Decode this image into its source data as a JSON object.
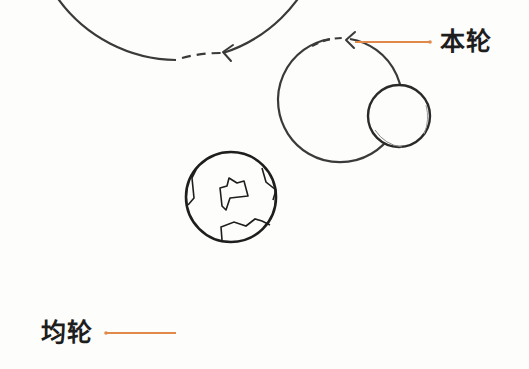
{
  "diagram": {
    "type": "epicycle-model",
    "labels": {
      "epicycle": "本轮",
      "deferent": "均轮"
    },
    "colors": {
      "line": "#3a3a3a",
      "leader": "#e0894a",
      "background": "#fdfdfb",
      "text": "#1e1e1e"
    },
    "elements": [
      {
        "name": "deferent",
        "shape": "circle",
        "cx": 231,
        "cy": 201,
        "r": 148,
        "direction_arrow": "counterclockwise"
      },
      {
        "name": "epicycle",
        "shape": "circle",
        "cx": 342,
        "cy": 100,
        "r": 62,
        "direction_arrow": "counterclockwise"
      },
      {
        "name": "earth",
        "shape": "circle",
        "cx": 231,
        "cy": 197,
        "r": 45
      },
      {
        "name": "planet",
        "shape": "circle",
        "cx": 399,
        "cy": 116,
        "r": 31
      }
    ]
  }
}
